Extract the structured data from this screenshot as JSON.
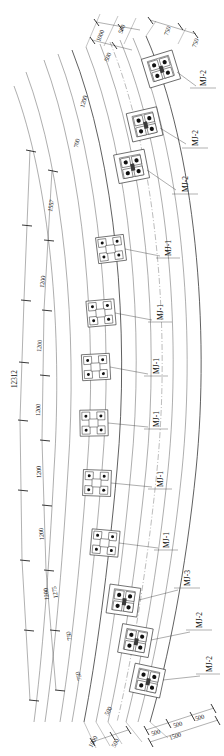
{
  "drawing": {
    "type": "structural-plan-arc",
    "description": "Curved arc girder plan with bolted joint locations",
    "overall_span_label": "12312",
    "ink_color": "#2b2b2b",
    "paper_color": "#ffffff"
  },
  "top_dimensions": {
    "stack_left": [
      "1000",
      "500",
      "500"
    ],
    "stack_right": [
      "750",
      "750"
    ],
    "spacing_chain": [
      "1200",
      "700"
    ]
  },
  "left_chain": {
    "label": "12312",
    "segments": [
      "1557",
      "1200",
      "1200",
      "1200",
      "1200",
      "1200",
      "1200",
      "1275"
    ]
  },
  "bottom_dimensions": {
    "stack_left": [
      "1000",
      "500",
      "500"
    ],
    "spacing_chain": [
      "750",
      "750"
    ],
    "base_chain": [
      "500",
      "500",
      "500"
    ],
    "base_total": "1500"
  },
  "joint_tags": [
    {
      "id": "j1",
      "label": "MJ-2",
      "type": "heavy"
    },
    {
      "id": "j2",
      "label": "MJ-2",
      "type": "heavy"
    },
    {
      "id": "j3",
      "label": "MJ-2",
      "type": "heavy"
    },
    {
      "id": "j4",
      "label": "MJ-1",
      "type": "light"
    },
    {
      "id": "j5",
      "label": "MJ-1",
      "type": "light"
    },
    {
      "id": "j6",
      "label": "MJ-1",
      "type": "light"
    },
    {
      "id": "j7",
      "label": "MJ-1",
      "type": "light"
    },
    {
      "id": "j8",
      "label": "MJ-1",
      "type": "light"
    },
    {
      "id": "j9",
      "label": "MJ-1",
      "type": "light"
    },
    {
      "id": "j10",
      "label": "MJ-3",
      "type": "heavy"
    },
    {
      "id": "j11",
      "label": "MJ-2",
      "type": "heavy"
    },
    {
      "id": "j12",
      "label": "MJ-2",
      "type": "heavy"
    }
  ]
}
